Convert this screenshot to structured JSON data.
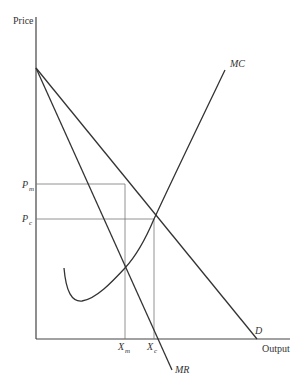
{
  "diagram": {
    "axes": {
      "y_label": "Price",
      "x_label": "Output"
    },
    "curves": {
      "demand": {
        "label": "D"
      },
      "marginal_revenue": {
        "label": "MR"
      },
      "marginal_cost": {
        "label": "MC"
      }
    },
    "price_levels": [
      {
        "id": "pm",
        "label": "P",
        "sub": "m"
      },
      {
        "id": "pc",
        "label": "P",
        "sub": "c"
      }
    ],
    "quantity_levels": [
      {
        "id": "xm",
        "label": "X",
        "sub": "m"
      },
      {
        "id": "xc",
        "label": "X",
        "sub": "c"
      }
    ],
    "colors": {
      "axis": "#444444",
      "curve": "#333333",
      "guide": "#777777"
    }
  }
}
